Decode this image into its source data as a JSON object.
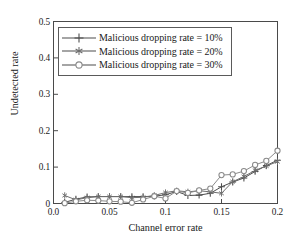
{
  "chart_data": {
    "type": "line",
    "title": "",
    "xlabel": "Channel error rate",
    "ylabel": "Undetected rate",
    "xlim": [
      0.0,
      0.2
    ],
    "ylim": [
      0.0,
      0.5
    ],
    "xticks": [
      "0.0",
      "0.05",
      "0.1",
      "0.15",
      "0.2"
    ],
    "xtick_values": [
      0.0,
      0.05,
      0.1,
      0.15,
      0.2
    ],
    "yticks": [
      "0",
      "0.1",
      "0.2",
      "0.3",
      "0.4",
      "0.5"
    ],
    "ytick_values": [
      0.0,
      0.1,
      0.2,
      0.3,
      0.4,
      0.5
    ],
    "grid": false,
    "legend_position": "upper left",
    "x": [
      0.01,
      0.02,
      0.03,
      0.04,
      0.05,
      0.06,
      0.07,
      0.08,
      0.09,
      0.1,
      0.11,
      0.12,
      0.13,
      0.14,
      0.15,
      0.16,
      0.17,
      0.18,
      0.19,
      0.2
    ],
    "series": [
      {
        "name": "Malicious dropping rate = 10%",
        "marker": "plus",
        "color": "#4d4d4d",
        "values": [
          0.003,
          0.012,
          0.018,
          0.019,
          0.019,
          0.019,
          0.019,
          0.019,
          0.02,
          0.024,
          0.033,
          0.022,
          0.023,
          0.028,
          0.046,
          0.059,
          0.07,
          0.088,
          0.104,
          0.119
        ]
      },
      {
        "name": "Malicious dropping rate = 20%",
        "marker": "star",
        "color": "#6e6e6e",
        "values": [
          0.022,
          0.01,
          0.016,
          0.019,
          0.019,
          0.019,
          0.016,
          0.017,
          0.022,
          0.03,
          0.035,
          0.032,
          0.035,
          0.032,
          0.028,
          0.06,
          0.074,
          0.091,
          0.103,
          0.115
        ]
      },
      {
        "name": "Malicious dropping rate = 30%",
        "marker": "circle",
        "color": "#8a8a8a",
        "values": [
          0.001,
          0.006,
          0.009,
          0.008,
          0.006,
          0.005,
          0.002,
          0.011,
          0.02,
          0.014,
          0.034,
          0.029,
          0.036,
          0.041,
          0.078,
          0.08,
          0.089,
          0.106,
          0.117,
          0.145
        ]
      }
    ]
  },
  "legend": {
    "items": [
      {
        "label": "Malicious dropping rate = 10%",
        "marker": "plus-marker"
      },
      {
        "label": "Malicious dropping rate = 20%",
        "marker": "star-marker"
      },
      {
        "label": "Malicious dropping rate = 30%",
        "marker": "circle-marker"
      }
    ]
  }
}
